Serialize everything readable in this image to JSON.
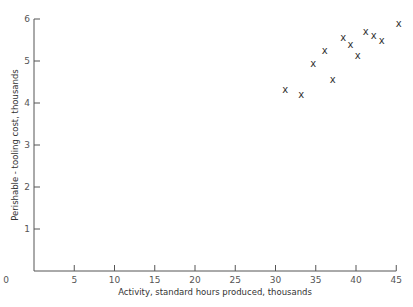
{
  "chart_data": {
    "type": "scatter",
    "title": "",
    "xlabel": "Activity, standard hours produced, thousands",
    "ylabel": "Perishable - tooling cost, thousands",
    "xlim": [
      0,
      45
    ],
    "ylim": [
      0,
      6
    ],
    "x_ticks": [
      0,
      5,
      10,
      15,
      20,
      25,
      30,
      35,
      40,
      45
    ],
    "y_ticks": [
      0,
      1,
      2,
      3,
      4,
      5,
      6
    ],
    "grid": false,
    "legend": null,
    "marker": "x",
    "points": [
      {
        "x": 31.2,
        "y": 4.33
      },
      {
        "x": 33.2,
        "y": 4.21
      },
      {
        "x": 34.7,
        "y": 4.95
      },
      {
        "x": 36.1,
        "y": 5.26
      },
      {
        "x": 37.1,
        "y": 4.55
      },
      {
        "x": 38.4,
        "y": 5.55
      },
      {
        "x": 39.3,
        "y": 5.4
      },
      {
        "x": 40.2,
        "y": 5.14
      },
      {
        "x": 41.2,
        "y": 5.71
      },
      {
        "x": 42.2,
        "y": 5.6
      },
      {
        "x": 43.2,
        "y": 5.5
      },
      {
        "x": 45.3,
        "y": 5.9
      }
    ]
  },
  "labels": {
    "x_axis_title": "Activity, standard hours produced, thousands",
    "y_axis_title": "Perishable - tooling cost, thousands",
    "origin": "0",
    "marker_glyph": "x"
  },
  "layout": {
    "x0_px": 34,
    "x_per_unit": 8.05,
    "y0_px": 271,
    "y_per_unit": 42
  }
}
